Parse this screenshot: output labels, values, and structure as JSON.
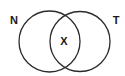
{
  "diagram": {
    "type": "venn",
    "sets": [
      {
        "label": "N",
        "cx": 49.5,
        "cy": 41.5,
        "r": 30.5
      },
      {
        "label": "T",
        "cx": 80,
        "cy": 41.5,
        "r": 30
      }
    ],
    "intersection_label": "X",
    "stroke_color": "#2b2b2b",
    "background": "#ffffff"
  }
}
